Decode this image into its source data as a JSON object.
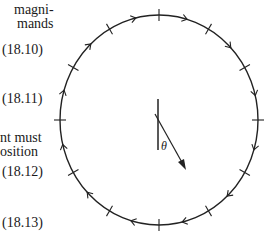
{
  "text_fragments": [
    {
      "id": "frag1",
      "text": "magni-",
      "x": 14,
      "y": 2
    },
    {
      "id": "frag2",
      "text": "mands",
      "x": 17,
      "y": 16
    },
    {
      "id": "frag3",
      "text": "nt must",
      "x": 0,
      "y": 130
    },
    {
      "id": "frag4",
      "text": "osition",
      "x": 0,
      "y": 144
    }
  ],
  "equation_numbers": [
    {
      "label": "(18.10)",
      "y": 50
    },
    {
      "label": "(18.11)",
      "y": 99
    },
    {
      "label": "(18.12)",
      "y": 172
    },
    {
      "label": "(18.13)",
      "y": 223
    }
  ],
  "figure": {
    "angle_label": "θ",
    "stroke_color": "#222222",
    "circle": {
      "cx": 159,
      "cy": 120,
      "rx": 99,
      "ry": 105
    },
    "tick_count": 12,
    "arrow_direction": "clockwise"
  }
}
